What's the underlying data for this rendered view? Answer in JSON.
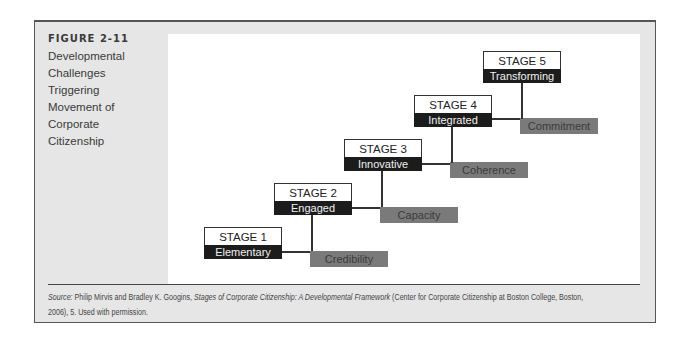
{
  "figure": {
    "number": "FIGURE 2-11",
    "title": "Developmental\nChallenges\nTriggering\nMovement of\nCorporate\nCitizenship"
  },
  "stages": [
    {
      "label": "STAGE 1",
      "name": "Elementary"
    },
    {
      "label": "STAGE 2",
      "name": "Engaged"
    },
    {
      "label": "STAGE 3",
      "name": "Innovative"
    },
    {
      "label": "STAGE 4",
      "name": "Integrated"
    },
    {
      "label": "STAGE 5",
      "name": "Transforming"
    }
  ],
  "challenges": [
    {
      "name": "Credibility"
    },
    {
      "name": "Capacity"
    },
    {
      "name": "Coherence"
    },
    {
      "name": "Commitment"
    }
  ],
  "source": {
    "prefix": "Source:",
    "authors": " Philip Mirvis and Bradley K. Googins, ",
    "title": "Stages of Corporate Citizenship: A Developmental Framework",
    "rest": " (Center for Corporate Citizenship at Boston College, Boston,",
    "line2": "2006), 5. Used with permission."
  },
  "colors": {
    "frame_bg": "#e6e6e6",
    "stage_dark": "#1c1c1c",
    "challenge_gray": "#7a7a7a"
  }
}
